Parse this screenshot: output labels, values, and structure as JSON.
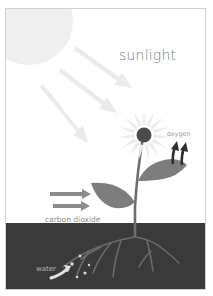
{
  "diagram": {
    "labels": {
      "sunlight": "sunlight",
      "oxygen": "oxygen",
      "carbon_dioxide": "carbon dioxide",
      "water": "water"
    },
    "elements": {
      "sun": "sun-circle",
      "sun_rays": "sunlight-arrows",
      "flower": "sunflower-head",
      "leaves": "leaves",
      "stem": "plant-stem",
      "roots": "roots",
      "soil": "soil"
    },
    "colors": {
      "background": "#ffffff",
      "border": "#d2d2d2",
      "sun": "#efefef",
      "sun_rays": "#ebebeb",
      "petals": "#ececec",
      "flower_center": "#4a4a4a",
      "stem": "#6e6e6e",
      "leaf": "#7d7d7d",
      "soil": "#3a3a3a",
      "roots": "#6a6a6a",
      "oxygen_arrows": "#2e2e2e",
      "co2_arrows": "#8c8c8c",
      "water": "#d8d8d8"
    }
  }
}
